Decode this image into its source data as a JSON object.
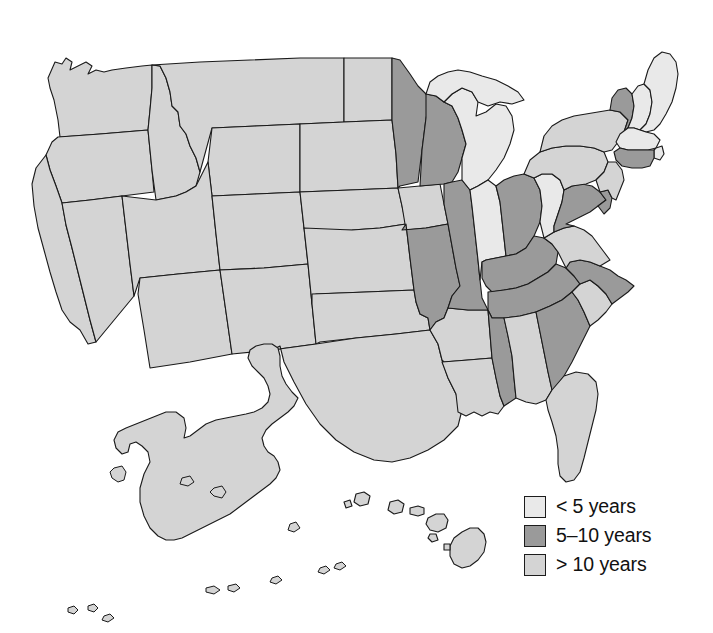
{
  "figure": {
    "type": "choropleth-map",
    "region": "United States",
    "background_color": "#ffffff",
    "border_color": "#1a1a1a"
  },
  "legend": {
    "name": "map-legend",
    "items": [
      {
        "label": "< 5 years",
        "color": "#e9e9e9",
        "category": "lt5"
      },
      {
        "label": "5–10 years",
        "color": "#9a9a9a",
        "category": "5to10"
      },
      {
        "label": "> 10 years",
        "color": "#d4d4d4",
        "category": "gt10"
      }
    ]
  },
  "chart_data": {
    "type": "map",
    "title": "",
    "xlabel": "",
    "ylabel": "",
    "legend_position": "bottom-right",
    "categories": [
      "< 5 years",
      "5–10 years",
      "> 10 years"
    ],
    "colors": [
      "#e9e9e9",
      "#9a9a9a",
      "#d4d4d4"
    ],
    "states": [
      {
        "code": "AL",
        "name": "Alabama",
        "category": "gt10"
      },
      {
        "code": "AK",
        "name": "Alaska",
        "category": "gt10"
      },
      {
        "code": "AZ",
        "name": "Arizona",
        "category": "gt10"
      },
      {
        "code": "AR",
        "name": "Arkansas",
        "category": "gt10"
      },
      {
        "code": "CA",
        "name": "California",
        "category": "gt10"
      },
      {
        "code": "CO",
        "name": "Colorado",
        "category": "gt10"
      },
      {
        "code": "CT",
        "name": "Connecticut",
        "category": "5to10"
      },
      {
        "code": "DE",
        "name": "Delaware",
        "category": "5to10"
      },
      {
        "code": "FL",
        "name": "Florida",
        "category": "gt10"
      },
      {
        "code": "GA",
        "name": "Georgia",
        "category": "5to10"
      },
      {
        "code": "HI",
        "name": "Hawaii",
        "category": "gt10"
      },
      {
        "code": "ID",
        "name": "Idaho",
        "category": "gt10"
      },
      {
        "code": "IL",
        "name": "Illinois",
        "category": "5to10"
      },
      {
        "code": "IN",
        "name": "Indiana",
        "category": "lt5"
      },
      {
        "code": "IA",
        "name": "Iowa",
        "category": "gt10"
      },
      {
        "code": "KS",
        "name": "Kansas",
        "category": "gt10"
      },
      {
        "code": "KY",
        "name": "Kentucky",
        "category": "5to10"
      },
      {
        "code": "LA",
        "name": "Louisiana",
        "category": "gt10"
      },
      {
        "code": "ME",
        "name": "Maine",
        "category": "lt5"
      },
      {
        "code": "MD",
        "name": "Maryland",
        "category": "5to10"
      },
      {
        "code": "MA",
        "name": "Massachusetts",
        "category": "lt5"
      },
      {
        "code": "MI",
        "name": "Michigan",
        "category": "lt5"
      },
      {
        "code": "MN",
        "name": "Minnesota",
        "category": "5to10"
      },
      {
        "code": "MS",
        "name": "Mississippi",
        "category": "5to10"
      },
      {
        "code": "MO",
        "name": "Missouri",
        "category": "5to10"
      },
      {
        "code": "MT",
        "name": "Montana",
        "category": "gt10"
      },
      {
        "code": "NE",
        "name": "Nebraska",
        "category": "gt10"
      },
      {
        "code": "NV",
        "name": "Nevada",
        "category": "gt10"
      },
      {
        "code": "NH",
        "name": "New Hampshire",
        "category": "lt5"
      },
      {
        "code": "NJ",
        "name": "New Jersey",
        "category": "gt10"
      },
      {
        "code": "NM",
        "name": "New Mexico",
        "category": "gt10"
      },
      {
        "code": "NY",
        "name": "New York",
        "category": "gt10"
      },
      {
        "code": "NC",
        "name": "North Carolina",
        "category": "5to10"
      },
      {
        "code": "ND",
        "name": "North Dakota",
        "category": "gt10"
      },
      {
        "code": "OH",
        "name": "Ohio",
        "category": "5to10"
      },
      {
        "code": "OK",
        "name": "Oklahoma",
        "category": "gt10"
      },
      {
        "code": "OR",
        "name": "Oregon",
        "category": "gt10"
      },
      {
        "code": "PA",
        "name": "Pennsylvania",
        "category": "gt10"
      },
      {
        "code": "RI",
        "name": "Rhode Island",
        "category": "lt5"
      },
      {
        "code": "SC",
        "name": "South Carolina",
        "category": "gt10"
      },
      {
        "code": "SD",
        "name": "South Dakota",
        "category": "gt10"
      },
      {
        "code": "TN",
        "name": "Tennessee",
        "category": "5to10"
      },
      {
        "code": "TX",
        "name": "Texas",
        "category": "gt10"
      },
      {
        "code": "UT",
        "name": "Utah",
        "category": "gt10"
      },
      {
        "code": "VT",
        "name": "Vermont",
        "category": "5to10"
      },
      {
        "code": "VA",
        "name": "Virginia",
        "category": "gt10"
      },
      {
        "code": "WA",
        "name": "Washington",
        "category": "gt10"
      },
      {
        "code": "WV",
        "name": "West Virginia",
        "category": "lt5"
      },
      {
        "code": "WI",
        "name": "Wisconsin",
        "category": "5to10"
      },
      {
        "code": "WY",
        "name": "Wyoming",
        "category": "gt10"
      }
    ],
    "counts": {
      "lt5": 7,
      "5to10": 14,
      "gt10": 29
    }
  },
  "geometry": {
    "states": {
      "WA": "M48,78 L55,62 L62,64 L66,58 L72,62 L70,70 L78,66 L86,62 L92,66 L88,74 L96,70 L104,72 L112,70 L126,68 L142,66 L152,65 L152,88 L150,110 L148,130 L100,134 L60,137 L58,120 L54,100 L50,88 Z",
      "OR": "M58,137 L100,134 L148,130 L150,150 L152,170 L154,192 L122,196 L90,200 L62,203 L56,186 L50,170 L46,155 L52,142 Z",
      "CA": "M46,155 L50,170 L56,186 L62,203 L66,225 L72,248 L78,272 L84,296 L90,320 L96,342 L88,344 L80,330 L70,322 L62,310 L56,292 L50,272 L44,250 L38,228 L34,206 L32,184 L36,168 Z",
      "NV": "M62,203 L90,200 L122,196 L126,230 L130,264 L134,296 L96,342 L90,320 L84,296 L78,272 L72,248 L66,225 Z",
      "ID": "M152,65 L160,66 L166,78 L170,92 L172,106 L178,112 L180,126 L186,134 L190,146 L196,158 L200,172 L196,186 L186,192 L176,196 L166,198 L156,200 L152,170 L150,150 L148,130 L150,110 L152,88 Z",
      "MT": "M152,65 L200,62 L250,60 L300,58 L344,58 L344,90 L344,122 L300,124 L256,126 L212,128 L200,172 L196,158 L190,146 L186,134 L180,126 L178,112 L172,106 L170,92 L166,78 L160,66 Z",
      "WY": "M212,128 L256,126 L300,124 L300,158 L300,192 L256,194 L212,196 L208,162 Z",
      "UT": "M156,200 L166,198 L176,196 L186,192 L196,186 L208,162 L212,196 L216,234 L220,270 L178,274 L140,278 L134,296 L130,264 L126,230 L122,196 Z",
      "CO": "M212,196 L256,194 L300,192 L304,228 L308,264 L264,268 L220,270 L216,234 Z",
      "AZ": "M140,278 L178,274 L220,270 L226,312 L232,354 L190,362 L150,368 L144,330 L138,294 Z",
      "NM": "M220,270 L264,268 L308,264 L312,304 L316,344 L272,350 L232,354 L226,312 Z",
      "ND": "M344,58 L392,58 L392,90 L392,120 L344,122 L344,90 Z",
      "SD": "M344,122 L392,120 L396,154 L398,188 L350,190 L300,192 L300,158 L300,124 Z",
      "NE": "M300,192 L350,190 L398,188 L402,206 L406,224 L380,228 L352,230 L308,232 L304,228 L300,192 Z",
      "KS": "M304,228 L352,230 L380,228 L406,224 L410,258 L414,290 L366,292 L316,294 L312,304 L308,264 Z",
      "OK": "M312,294 L366,292 L414,290 L416,302 L420,314 L428,318 L430,330 L396,334 L356,338 L320,342 L316,344 L312,304 Z",
      "TX": "M316,344 L356,338 L396,334 L430,330 L438,344 L442,360 L448,378 L456,394 L462,410 L458,426 L444,440 L428,450 L410,458 L392,462 L374,460 L354,452 L336,440 L320,424 L306,404 L294,382 L284,362 L280,346 L272,350 Z",
      "MN": "M392,58 L400,60 L410,74 L418,86 L426,94 L430,104 L426,118 L424,134 L422,150 L420,166 L418,182 L400,186 L398,188 L396,154 L392,120 L392,90 Z",
      "IA": "M398,188 L420,186 L440,184 L444,204 L448,224 L426,228 L406,230 L402,206 Z",
      "MO": "M402,230 L426,228 L448,224 L452,246 L456,268 L460,286 L452,296 L448,308 L444,318 L436,322 L430,330 L428,318 L420,314 L416,302 L414,290 L410,258 L406,224 Z",
      "AR": "M430,330 L436,322 L444,318 L448,308 L468,310 L488,310 L490,334 L492,358 L468,360 L444,362 L442,360 L438,344 Z",
      "LA": "M442,362 L468,360 L492,358 L496,378 L500,396 L504,406 L498,414 L490,412 L482,416 L474,412 L466,416 L458,412 L456,394 L448,378 Z",
      "WI": "M426,94 L436,96 L444,102 L452,106 L458,118 L462,130 L466,144 L462,158 L458,172 L452,182 L444,184 L420,186 L422,150 L424,134 L426,118 Z",
      "IL": "M444,184 L452,182 L462,180 L470,190 L472,206 L474,224 L476,242 L478,260 L480,280 L482,298 L488,310 L468,310 L448,308 L452,296 L460,286 L456,268 L452,246 L448,224 L444,204 Z",
      "MI": "M444,102 L452,94 L462,88 L472,92 L478,102 L476,116 L486,112 L496,104 L506,106 L512,116 L514,130 L510,144 L504,158 L496,170 L488,180 L478,186 L470,190 L462,180 L462,158 L466,144 L462,130 L458,118 L452,106 Z",
      "MI_UP": "M426,94 L430,82 L438,76 L448,72 L458,70 L470,72 L482,76 L496,80 L508,86 L518,92 L524,100 L512,104 L500,102 L488,106 L478,102 L472,92 L462,88 L452,94 L444,102 L436,96 Z",
      "IN": "M470,190 L478,186 L488,180 L496,186 L500,202 L502,220 L504,238 L506,256 L486,260 L482,262 L480,280 L478,260 L476,242 L474,224 L472,206 Z",
      "OH": "M496,186 L504,180 L514,176 L524,174 L534,178 L540,190 L542,206 L540,222 L534,236 L526,248 L516,254 L506,256 L504,238 L502,220 L500,202 Z",
      "KY": "M486,260 L506,256 L516,254 L526,248 L534,236 L544,238 L552,244 L558,252 L556,264 L548,272 L538,278 L528,284 L516,288 L504,290 L492,292 L486,286 L482,278 L482,262 Z",
      "TN": "M488,292 L504,290 L516,288 L528,284 L538,278 L548,272 L556,264 L566,268 L574,276 L580,284 L572,292 L562,300 L550,306 L536,312 L520,316 L504,318 L492,318 L488,310 Z",
      "MS": "M492,358 L490,334 L488,310 L492,318 L504,318 L508,336 L512,356 L514,378 L516,398 L504,406 L500,396 L496,378 Z",
      "AL": "M508,336 L504,318 L520,316 L536,312 L540,332 L544,352 L548,372 L552,390 L546,400 L536,404 L526,402 L516,398 L514,378 L512,356 Z",
      "GA": "M540,332 L536,312 L550,306 L562,300 L572,292 L578,300 L584,312 L590,326 L584,338 L578,350 L572,362 L564,376 L554,390 L552,390 L548,372 L544,352 Z",
      "FL": "M546,400 L552,390 L564,376 L576,372 L588,374 L596,382 L598,394 L596,410 L592,426 L588,442 L584,458 L580,472 L574,480 L566,482 L560,476 L558,464 L558,450 L556,436 L552,422 L548,410 Z",
      "SC": "M572,292 L578,300 L584,312 L590,326 L598,320 L606,312 L612,304 L606,294 L598,286 L590,280 L580,284 Z",
      "NC": "M566,268 L574,276 L580,284 L590,280 L598,286 L606,294 L612,304 L620,298 L628,292 L634,286 L626,280 L618,276 L610,270 L600,266 L590,262 L580,260 L570,262 Z",
      "VA": "M544,238 L554,232 L564,228 L574,226 L584,230 L592,236 L598,244 L604,252 L610,260 L600,266 L590,262 L580,260 L570,262 L566,268 L558,252 L552,244 Z",
      "WV": "M534,178 L542,174 L552,174 L560,180 L564,190 L562,202 L558,214 L554,226 L554,232 L544,238 L540,222 L542,206 L540,190 Z",
      "MD": "M564,190 L572,186 L582,184 L592,186 L600,192 L606,200 L598,206 L590,212 L582,216 L574,220 L566,224 L574,226 L564,228 L554,232 L554,226 L558,214 L562,202 Z",
      "DE": "M600,192 L608,190 L612,198 L610,208 L604,214 L598,206 L606,200 Z",
      "PA": "M524,174 L530,160 L540,152 L552,148 L566,146 L580,146 L594,148 L604,152 L608,162 L604,172 L596,180 L586,184 L572,186 L564,190 L560,180 L552,174 L542,174 L534,178 Z",
      "NJ": "M608,162 L616,162 L622,170 L624,180 L620,190 L616,200 L612,198 L608,190 L600,192 L596,180 L604,172 Z",
      "NY": "M540,152 L544,136 L552,126 L562,120 L574,116 L586,114 L598,112 L610,110 L620,112 L628,120 L624,132 L618,142 L612,150 L604,152 L594,148 L580,146 L566,146 L552,148 Z",
      "VT": "M610,110 L612,98 L618,90 L626,88 L632,94 L634,106 L632,118 L628,128 L624,132 L628,120 L620,112 Z",
      "NH": "M632,94 L638,86 L644,84 L650,90 L652,102 L650,114 L646,124 L640,130 L634,128 L628,128 L632,118 L634,106 Z",
      "ME": "M644,84 L648,70 L654,58 L662,52 L670,54 L676,62 L678,74 L676,88 L672,102 L666,114 L660,124 L654,130 L646,132 L640,130 L646,124 L650,114 L652,102 L650,90 Z",
      "MA": "M628,128 L634,128 L640,130 L646,132 L654,134 L660,140 L656,148 L648,150 L638,150 L628,150 L620,148 L616,142 L620,134 Z",
      "RI": "M656,148 L662,146 L664,154 L660,160 L654,158 L654,150 Z",
      "CT": "M620,148 L628,150 L638,150 L648,150 L654,150 L654,158 L650,166 L642,168 L632,168 L622,166 L616,160 L614,152 Z",
      "AK": "M150,528 L144,516 L140,502 L140,488 L144,474 L150,462 L148,452 L142,446 L136,442 L130,444 L128,452 L122,454 L116,448 L114,440 L118,432 L126,428 L136,424 L146,420 L156,416 L166,412 L176,412 L184,418 L186,428 L184,438 L190,436 L198,430 L206,424 L216,420 L226,418 L236,416 L246,414 L254,412 L262,408 L268,402 L270,394 L268,386 L264,378 L258,372 L252,366 L248,358 L250,350 L256,346 L264,344 L272,344 L278,348 L280,356 L280,366 L282,376 L286,384 L292,392 L298,398 L294,406 L288,412 L280,418 L272,424 L266,430 L262,438 L264,446 L268,452 L274,456 L278,462 L280,470 L276,478 L270,484 L262,490 L254,496 L246,502 L238,508 L230,514 L222,518 L214,522 L206,526 L198,530 L190,534 L182,538 L174,540 L166,540 L158,536 Z",
      "HI_BIG": "M454,538 L462,532 L470,528 L478,528 L484,534 L486,542 L484,552 L478,560 L470,566 L462,568 L454,564 L450,556 L450,546 Z",
      "HI_MAUI": "M428,518 L436,514 L444,514 L448,520 L446,528 L438,532 L430,530 L426,524 Z",
      "HI_MOLO": "M410,508 L418,506 L424,508 L424,514 L418,516 L410,514 Z",
      "HI_OAHU": "M390,502 L398,500 L404,504 L402,512 L394,514 L388,510 Z",
      "HI_KAUAI": "M356,494 L364,492 L370,496 L368,504 L360,506 L354,502 Z",
      "HI_LANAI": "M430,534 L436,534 L438,540 L432,542 L428,538 Z",
      "HI_NIIHAU": "M344,502 L350,500 L352,506 L346,508 Z",
      "HI_KAHO": "M444,544 L450,544 L450,550 L444,550 Z"
    },
    "islets": [
      "M88,606 L94,604 L98,608 L94,612 L88,610 Z",
      "M68,608 L74,606 L78,610 L74,614 L68,612 Z",
      "M104,616 L110,614 L114,618 L108,622 L102,620 Z",
      "M206,588 L214,586 L220,590 L214,594 L206,592 Z",
      "M228,586 L236,584 L240,588 L234,592 L228,590 Z",
      "M272,578 L278,576 L282,580 L276,584 L270,582 Z",
      "M320,568 L326,566 L330,570 L324,574 L318,572 Z",
      "M336,564 L342,562 L346,566 L340,570 L334,568 Z",
      "M114,468 L122,466 L126,472 L124,480 L118,482 L112,478 L110,472 Z",
      "M290,524 L296,522 L300,528 L294,532 L288,530 Z",
      "M214,488 L222,486 L226,492 L222,498 L214,496 L210,492 Z",
      "M182,478 L190,476 L194,482 L188,486 L180,484 Z"
    ]
  }
}
